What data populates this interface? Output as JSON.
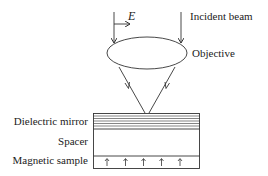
{
  "labels": {
    "incident_beam": "Incident beam",
    "objective": "Objective",
    "field": "E",
    "dielectric_mirror": "Dielectric mirror",
    "spacer": "Spacer",
    "magnetic_sample": "Magnetic sample"
  },
  "colors": {
    "stroke": "#333333",
    "text": "#222222",
    "background": "#ffffff"
  },
  "structure": {
    "mirror_layer_count": 6,
    "magnetization_arrow_count": 5,
    "magnetization_direction": "up"
  }
}
